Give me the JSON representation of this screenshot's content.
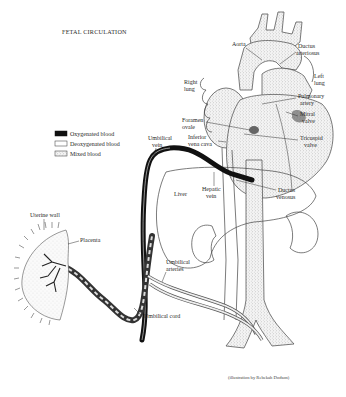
{
  "title": "FETAL CIRCULATION",
  "legend": {
    "items": [
      {
        "label": "Oxygenated blood",
        "swatch": "solid",
        "color": "#111111"
      },
      {
        "label": "Deoxygenated blood",
        "swatch": "empty",
        "color": "#ffffff"
      },
      {
        "label": "Mixed blood",
        "swatch": "stippled",
        "color": "#cfcfcf"
      }
    ]
  },
  "labels": {
    "aorta": "Aorta",
    "ductus_arteriosus_1": "Ductus",
    "ductus_arteriosus_2": "arteriosus",
    "left_lung_1": "Left",
    "left_lung_2": "lung",
    "right_lung_1": "Right",
    "right_lung_2": "lung",
    "pulmonary_artery_1": "Pulmonary",
    "pulmonary_artery_2": "artery",
    "mitral_valve_1": "Mitral",
    "mitral_valve_2": "valve",
    "foramen_ovale_1": "Foramen",
    "foramen_ovale_2": "ovale",
    "inferior_vena_cava_1": "Inferior",
    "inferior_vena_cava_2": "vena cava",
    "tricuspid_valve_1": "Tricuspid",
    "tricuspid_valve_2": "valve",
    "umbilical_vein_1": "Umbilical",
    "umbilical_vein_2": "vein",
    "hepatic_vein_1": "Hepatic",
    "hepatic_vein_2": "vein",
    "ductus_venosus_1": "Ductus",
    "ductus_venosus_2": "venosus",
    "liver": "Liver",
    "uterine_wall": "Uterine wall",
    "placenta": "Placenta",
    "umbilical_arteries_1": "Umbilical",
    "umbilical_arteries_2": "arteries",
    "umbilical_cord": "Umbilical cord"
  },
  "caption": "(illustration by Rebekah Dodson)"
}
